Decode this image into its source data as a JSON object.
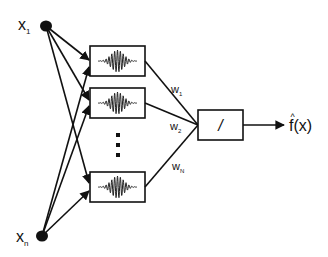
{
  "diagram": {
    "type": "wavelet-network",
    "inputs": [
      {
        "id": "x1",
        "label": "x",
        "subscript": "1"
      },
      {
        "id": "xn",
        "label": "x",
        "subscript": "n"
      }
    ],
    "wavelet_units": [
      {
        "id": "unit-1",
        "icon": "wavelet-icon"
      },
      {
        "id": "unit-2",
        "icon": "wavelet-icon"
      },
      {
        "id": "unit-N",
        "icon": "wavelet-icon"
      }
    ],
    "ellipsis": "⋮",
    "weights": [
      {
        "label": "w",
        "subscript": "1"
      },
      {
        "label": "w",
        "subscript": "2"
      },
      {
        "label": "w",
        "subscript": "N"
      }
    ],
    "output_node": {
      "symbol": "/"
    },
    "output": {
      "label": "f",
      "hat": "^",
      "arg": "(x)"
    },
    "colors": {
      "stroke": "#111111",
      "background": "#ffffff"
    }
  }
}
